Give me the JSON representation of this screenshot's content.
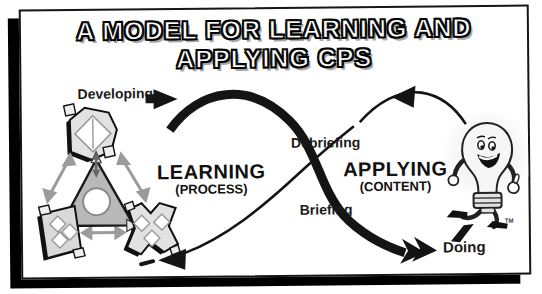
{
  "title": {
    "line1": "A MODEL FOR LEARNING AND",
    "line2": "APPLYING CPS"
  },
  "flow_labels": {
    "developing": "Developing",
    "debriefing": "Debriefing",
    "briefing": "Briefing",
    "doing": "Doing"
  },
  "loops": {
    "learning": {
      "name": "LEARNING",
      "qualifier": "(PROCESS)"
    },
    "applying": {
      "name": "APPLYING",
      "qualifier": "(CONTENT)"
    }
  },
  "trademark": "TM",
  "icons": {
    "triad": "cps-process-triad-icon",
    "mascot": "running-lightbulb-mascot-icon",
    "flow_arrows": "infinity-flow-arrows"
  },
  "colors": {
    "ink": "#141414",
    "page_bg": "#ffffff",
    "frame_shadow": "#000000",
    "shape_fill": "#d9d9d9",
    "triangle_fill": "#b9b9b9",
    "title_fill": "#ffffff",
    "title_outline": "#000000",
    "title_shadow": "#a8a8a8"
  }
}
